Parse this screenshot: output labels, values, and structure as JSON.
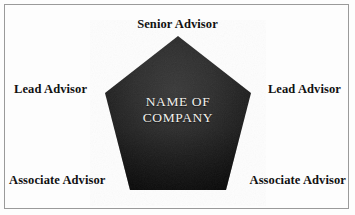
{
  "diagram": {
    "background_color": "#fdfdfd",
    "frame_color": "#9a9a9a",
    "center": {
      "line1": "NAME OF",
      "line2": "COMPANY",
      "text_color": "#f2f0ec",
      "shape": "pentagon",
      "fill_dark": "#161616",
      "fill_light": "#3a3a3a"
    },
    "roles": [
      {
        "id": "senior-advisor",
        "label": "Senior Advisor",
        "position": "top"
      },
      {
        "id": "lead-advisor-left",
        "label": "Lead Advisor",
        "position": "left"
      },
      {
        "id": "lead-advisor-right",
        "label": "Lead Advisor",
        "position": "right"
      },
      {
        "id": "associate-advisor-left",
        "label": "Associate Advisor",
        "position": "bottom-left"
      },
      {
        "id": "associate-advisor-right",
        "label": "Associate Advisor",
        "position": "bottom-right"
      }
    ]
  }
}
